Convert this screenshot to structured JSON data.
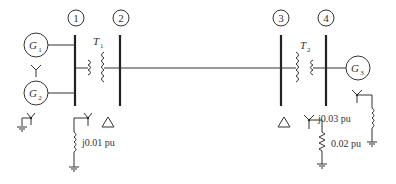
{
  "diagram": {
    "title": "",
    "buses": [
      {
        "id": "1",
        "label": "1"
      },
      {
        "id": "2",
        "label": "2"
      },
      {
        "id": "3",
        "label": "3"
      },
      {
        "id": "4",
        "label": "4"
      }
    ],
    "generators": [
      {
        "name": "G",
        "sub": "1",
        "connection": "wye"
      },
      {
        "name": "G",
        "sub": "2",
        "connection": "wye-grounded"
      },
      {
        "name": "G",
        "sub": "3",
        "connection": "wye-grounded through reactance"
      }
    ],
    "transformers": [
      {
        "name": "T",
        "sub": "1",
        "primary": "wye-grounded through reactance",
        "secondary": "delta"
      },
      {
        "name": "T",
        "sub": "2",
        "primary": "delta",
        "secondary": "wye-grounded through resistance"
      }
    ],
    "impedances": {
      "t1_neutral": "j0.01 pu",
      "g3_neutral": "j0.03 pu",
      "t2_neutral": "0.02 pu"
    },
    "colors": {
      "stroke": "#333333",
      "background": "#ffffff"
    }
  }
}
